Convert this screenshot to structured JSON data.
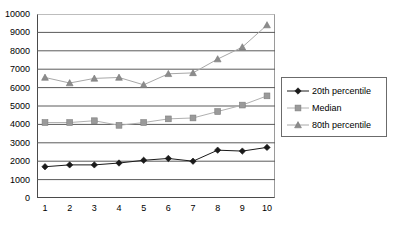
{
  "chart_data": {
    "type": "line",
    "title": "",
    "xlabel": "",
    "ylabel": "",
    "x": [
      1,
      2,
      3,
      4,
      5,
      6,
      7,
      8,
      9,
      10
    ],
    "categories": [
      "1",
      "2",
      "3",
      "4",
      "5",
      "6",
      "7",
      "8",
      "9",
      "10"
    ],
    "ylim": [
      0,
      10000
    ],
    "xlim": [
      1,
      10
    ],
    "y_ticks": [
      0,
      1000,
      2000,
      3000,
      4000,
      5000,
      6000,
      7000,
      8000,
      9000,
      10000
    ],
    "y_tick_labels": [
      "0",
      "1000",
      "2000",
      "3000",
      "4000",
      "5000",
      "6000",
      "7000",
      "8000",
      "9000",
      "10000"
    ],
    "grid": "horizontal",
    "legend_position": "right",
    "series": [
      {
        "name": "20th percentile",
        "marker": "diamond",
        "color": "#1a1a1a",
        "line_color": "#1a1a1a",
        "values": [
          1700,
          1800,
          1800,
          1900,
          2050,
          2150,
          2000,
          2600,
          2550,
          2750
        ]
      },
      {
        "name": "Median",
        "marker": "square",
        "color": "#9a9a9a",
        "line_color": "#b0b0b0",
        "values": [
          4100,
          4100,
          4200,
          3950,
          4100,
          4300,
          4350,
          4700,
          5050,
          5550
        ]
      },
      {
        "name": "80th percentile",
        "marker": "triangle",
        "color": "#8c8c8c",
        "line_color": "#a8a8a8",
        "values": [
          6550,
          6250,
          6500,
          6550,
          6150,
          6750,
          6800,
          7550,
          8200,
          9400
        ]
      }
    ]
  },
  "legend": {
    "items": [
      {
        "label": "20th percentile"
      },
      {
        "label": "Median"
      },
      {
        "label": "80th percentile"
      }
    ]
  },
  "colors": {
    "axis": "#4a4a4a",
    "gridline": "#5a5a5a",
    "background": "#ffffff",
    "text": "#000000",
    "legend_border": "#6b6b6b"
  }
}
